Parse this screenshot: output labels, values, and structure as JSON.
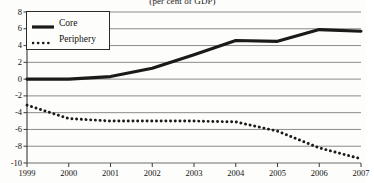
{
  "chart_data": {
    "type": "line",
    "title": "(per cent of GDP)",
    "xlabel": "",
    "ylabel": "",
    "x": [
      1999,
      2000,
      2001,
      2002,
      2003,
      2004,
      2005,
      2006,
      2007
    ],
    "categories": [
      "1999",
      "2000",
      "2001",
      "2002",
      "2003",
      "2004",
      "2005",
      "2006",
      "2007"
    ],
    "xlim": [
      1999,
      2007
    ],
    "ylim": [
      -10,
      8
    ],
    "yticks": [
      8,
      6,
      4,
      2,
      0,
      -2,
      -4,
      -6,
      -8,
      -10
    ],
    "ytick_labels": [
      "8",
      "6",
      "4",
      "2",
      "0",
      "-2",
      "-4",
      "-6",
      "-8",
      "-10"
    ],
    "grid": true,
    "legend_position": "top-left",
    "series": [
      {
        "name": "Core",
        "style": "solid",
        "color": "#1a1a1a",
        "values": [
          0.0,
          0.0,
          0.3,
          1.3,
          2.9,
          4.6,
          4.5,
          5.9,
          5.7
        ]
      },
      {
        "name": "Periphery",
        "style": "dotted",
        "color": "#1a1a1a",
        "values": [
          -3.1,
          -4.7,
          -5.0,
          -5.0,
          -5.0,
          -5.1,
          -6.2,
          -8.2,
          -9.5
        ]
      }
    ]
  },
  "legend": {
    "core_label": "Core",
    "periphery_label": "Periphery"
  }
}
